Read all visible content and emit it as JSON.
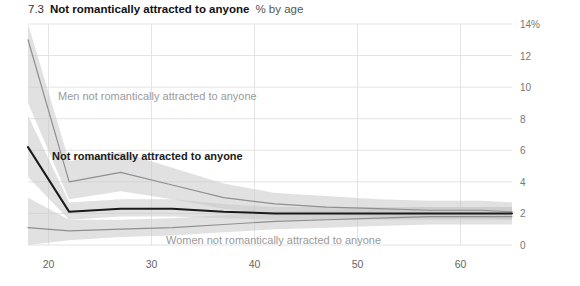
{
  "title": {
    "number": "7.3",
    "main": "Not romantically attracted to anyone",
    "subtitle": "% by age"
  },
  "axes": {
    "y_ticks": [
      "14%",
      "12",
      "10",
      "8",
      "6",
      "4",
      "2",
      "0"
    ],
    "x_ticks": [
      "20",
      "30",
      "40",
      "50",
      "60"
    ]
  },
  "annotations": {
    "men": "Men not romantically attracted to anyone",
    "all": "Not romantically attracted to anyone",
    "women": "Women not romantically attracted to anyone"
  },
  "colors": {
    "all_line": "#1a1a1a",
    "men_line": "#8f8f8f",
    "women_line": "#8f8f8f",
    "band": "#c9c9c9",
    "grid": "#e3e3e3",
    "tick_text": "#777777"
  },
  "chart_data": {
    "type": "line",
    "title": "Not romantically attracted to anyone",
    "subtitle": "% by age",
    "xlabel": "age",
    "ylabel": "%",
    "xlim": [
      18,
      65
    ],
    "ylim": [
      0,
      14
    ],
    "x_ticks": [
      20,
      30,
      40,
      50,
      60
    ],
    "y_ticks": [
      0,
      2,
      4,
      6,
      8,
      10,
      12,
      14
    ],
    "grid": true,
    "legend": "inline-annotations",
    "x": [
      18,
      22,
      27,
      32,
      37,
      42,
      47,
      52,
      57,
      62,
      65
    ],
    "series": [
      {
        "name": "Men not romantically attracted to anyone",
        "color": "#8f8f8f",
        "values": [
          13.0,
          4.0,
          4.6,
          3.8,
          3.0,
          2.6,
          2.4,
          2.3,
          2.2,
          2.2,
          2.1
        ],
        "band_low": [
          9.0,
          2.9,
          3.4,
          2.9,
          2.3,
          2.0,
          1.9,
          1.8,
          1.7,
          1.7,
          1.6
        ],
        "band_high": [
          14.0,
          5.3,
          5.9,
          4.9,
          3.9,
          3.3,
          3.1,
          2.9,
          2.8,
          2.8,
          2.7
        ]
      },
      {
        "name": "Not romantically attracted to anyone",
        "color": "#1a1a1a",
        "values": [
          6.2,
          2.1,
          2.3,
          2.3,
          2.1,
          2.0,
          2.0,
          2.0,
          2.0,
          2.0,
          2.0
        ],
        "band_low": [
          4.3,
          1.6,
          1.8,
          1.8,
          1.7,
          1.6,
          1.6,
          1.6,
          1.6,
          1.6,
          1.6
        ],
        "band_high": [
          8.2,
          2.7,
          2.9,
          2.9,
          2.6,
          2.4,
          2.4,
          2.4,
          2.4,
          2.4,
          2.4
        ]
      },
      {
        "name": "Women not romantically attracted to anyone",
        "color": "#8f8f8f",
        "values": [
          1.1,
          0.9,
          1.0,
          1.1,
          1.3,
          1.5,
          1.6,
          1.7,
          1.8,
          1.8,
          1.8
        ],
        "band_low": [
          0.0,
          0.3,
          0.5,
          0.6,
          0.8,
          1.0,
          1.1,
          1.2,
          1.3,
          1.3,
          1.3
        ],
        "band_high": [
          3.0,
          1.6,
          1.6,
          1.7,
          1.9,
          2.1,
          2.2,
          2.3,
          2.4,
          2.4,
          2.4
        ]
      }
    ]
  }
}
